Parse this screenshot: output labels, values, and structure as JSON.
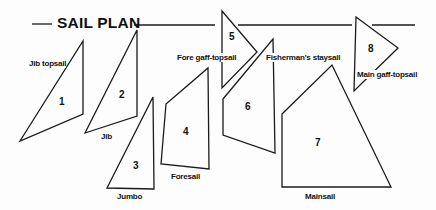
{
  "title": "SAIL PLAN",
  "colors": {
    "line": "#1a1a1a",
    "background": "#fdfdfd"
  },
  "sails": [
    {
      "number": "1",
      "name": "Jib topsail"
    },
    {
      "number": "2",
      "name": "Jib"
    },
    {
      "number": "3",
      "name": "Jumbo"
    },
    {
      "number": "4",
      "name": "Foresail"
    },
    {
      "number": "5",
      "name": "Fore gaff-topsail"
    },
    {
      "number": "6",
      "name": "Fisherman's staysail"
    },
    {
      "number": "7",
      "name": "Mainsail"
    },
    {
      "number": "8",
      "name": "Main gaff-topsail"
    }
  ]
}
